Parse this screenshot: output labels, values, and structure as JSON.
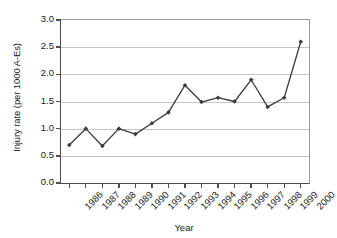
{
  "chart_data": {
    "type": "line",
    "title": "",
    "xlabel": "Year",
    "ylabel": "Injury rate (per 1000 A-Es)",
    "categories": [
      "1986",
      "1987",
      "1988",
      "1989",
      "1990",
      "1991",
      "1992",
      "1993",
      "1994",
      "1995",
      "1996",
      "1997",
      "1998",
      "1999",
      "2000"
    ],
    "values": [
      0.7,
      1.0,
      0.68,
      1.0,
      0.9,
      1.1,
      1.3,
      1.8,
      1.49,
      1.57,
      1.5,
      1.9,
      1.4,
      1.57,
      2.6
    ],
    "series": [
      {
        "name": "Injury rate",
        "values": [
          0.7,
          1.0,
          0.68,
          1.0,
          0.9,
          1.1,
          1.3,
          1.8,
          1.49,
          1.57,
          1.5,
          1.9,
          1.4,
          1.57,
          2.6
        ]
      }
    ],
    "ylim": [
      0.0,
      3.0
    ],
    "ytick_labels": [
      "0.0",
      "0.5",
      "1.0",
      "1.5",
      "2.0",
      "2.5",
      "3.0"
    ],
    "ytick_values": [
      0.0,
      0.5,
      1.0,
      1.5,
      2.0,
      2.5,
      3.0
    ],
    "grid": "horizontal",
    "legend": "none",
    "marker": "diamond",
    "line_color": "#3c3c3c",
    "grid_color": "#c4c4c4",
    "axis_color": "#4d4d4d",
    "text_color": "#1a1a1a",
    "background": "#ffffff"
  }
}
